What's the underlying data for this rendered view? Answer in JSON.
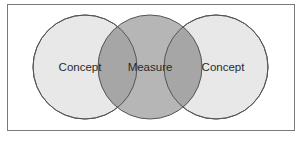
{
  "diagram": {
    "type": "venn",
    "circles": [
      {
        "label": "Concept",
        "fill": "#e8e8e8"
      },
      {
        "label": "Measure",
        "fill": "#b4b4b4"
      },
      {
        "label": "Concept",
        "fill": "#e8e8e8"
      }
    ],
    "overlap_fill": "#a4a4a4",
    "stroke": "#555555",
    "frame_stroke": "#7a7a7a"
  }
}
